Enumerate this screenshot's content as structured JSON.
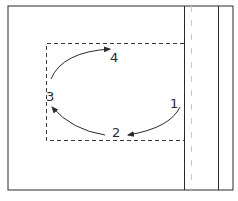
{
  "diagram": {
    "type": "rotation-sequence",
    "labels": [
      {
        "id": "1",
        "text": "1",
        "x": 170,
        "y": 97
      },
      {
        "id": "2",
        "text": "2",
        "x": 112,
        "y": 126
      },
      {
        "id": "3",
        "text": "3",
        "x": 46,
        "y": 90
      },
      {
        "id": "4",
        "text": "4",
        "x": 110,
        "y": 51
      }
    ],
    "arrows": [
      {
        "from": "1",
        "to": "2"
      },
      {
        "from": "2",
        "to": "3"
      },
      {
        "from": "3",
        "to": "4"
      }
    ],
    "colors": {
      "line": "#2a2a2a",
      "dashed": "#3a3a3a",
      "faint": "#bbbbbb"
    }
  }
}
